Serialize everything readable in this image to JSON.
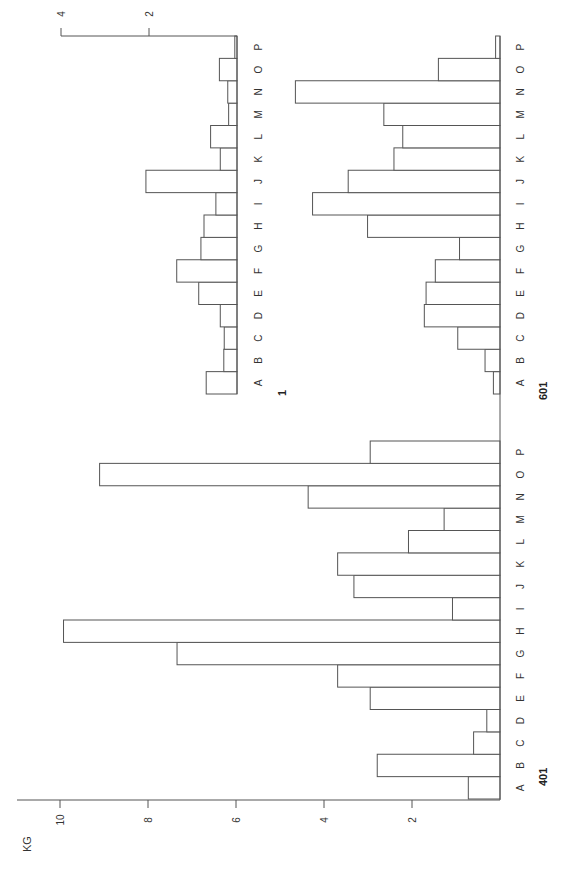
{
  "chart_data": [
    {
      "type": "bar",
      "orientation": "rotated-90",
      "title": "401",
      "categories": [
        "A",
        "B",
        "C",
        "D",
        "E",
        "F",
        "G",
        "H",
        "I",
        "J",
        "K",
        "L",
        "M",
        "N",
        "O",
        "P"
      ],
      "values": [
        0.72,
        2.79,
        0.6,
        0.3,
        2.95,
        3.69,
        7.34,
        9.92,
        1.08,
        3.32,
        3.69,
        2.08,
        1.27,
        4.36,
        9.1,
        2.95
      ],
      "ylabel": "KG",
      "yticks": [
        2,
        4,
        6,
        8,
        10
      ],
      "ylim": [
        0,
        10.5
      ]
    },
    {
      "type": "bar",
      "orientation": "rotated-90",
      "title": "1",
      "categories": [
        "A",
        "B",
        "C",
        "D",
        "E",
        "F",
        "G",
        "H",
        "I",
        "J",
        "K",
        "L",
        "M",
        "N",
        "O",
        "P"
      ],
      "values": [
        0.7,
        0.3,
        0.29,
        0.38,
        0.87,
        1.37,
        0.82,
        0.75,
        0.48,
        2.07,
        0.38,
        0.6,
        0.19,
        0.21,
        0.4,
        0.05
      ],
      "yticks": [
        2,
        4
      ],
      "ylim": [
        0,
        4
      ]
    },
    {
      "type": "bar",
      "orientation": "rotated-90",
      "title": "601",
      "categories": [
        "A",
        "B",
        "C",
        "D",
        "E",
        "F",
        "G",
        "H",
        "I",
        "J",
        "K",
        "L",
        "M",
        "N",
        "O",
        "P"
      ],
      "values": [
        0.15,
        0.34,
        0.96,
        1.72,
        1.68,
        1.47,
        0.92,
        3.01,
        4.26,
        3.45,
        2.41,
        2.21,
        2.64,
        4.65,
        1.4,
        0.1
      ],
      "ylim": [
        0,
        4.7
      ]
    }
  ],
  "labels": {
    "unit": "KG",
    "panel_401": "401",
    "panel_1": "1",
    "panel_601": "601"
  }
}
